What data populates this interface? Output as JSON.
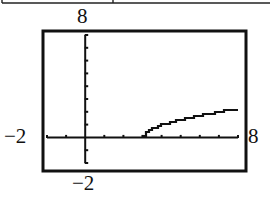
{
  "chart_data": {
    "type": "line",
    "title": "",
    "xlabel": "",
    "ylabel": "",
    "function": "y = sqrt(x - 3)",
    "xlim": [
      -2,
      8
    ],
    "ylim": [
      -2,
      8
    ],
    "xscale": 1,
    "yscale": 1,
    "grid": false,
    "legend": null,
    "window_labels": {
      "xmin": "−2",
      "xmax": "8",
      "ymin": "−2",
      "ymax": "8"
    },
    "series": [
      {
        "name": "y = √(x − 3)",
        "x": [
          3,
          3.25,
          3.5,
          4,
          4.5,
          5,
          5.5,
          6,
          6.5,
          7,
          7.5,
          8
        ],
        "y": [
          0,
          0.5,
          0.71,
          1,
          1.22,
          1.41,
          1.58,
          1.73,
          1.87,
          2,
          2.12,
          2.24
        ]
      }
    ]
  },
  "colors": {
    "ink": "#111111",
    "background": "#ffffff"
  }
}
